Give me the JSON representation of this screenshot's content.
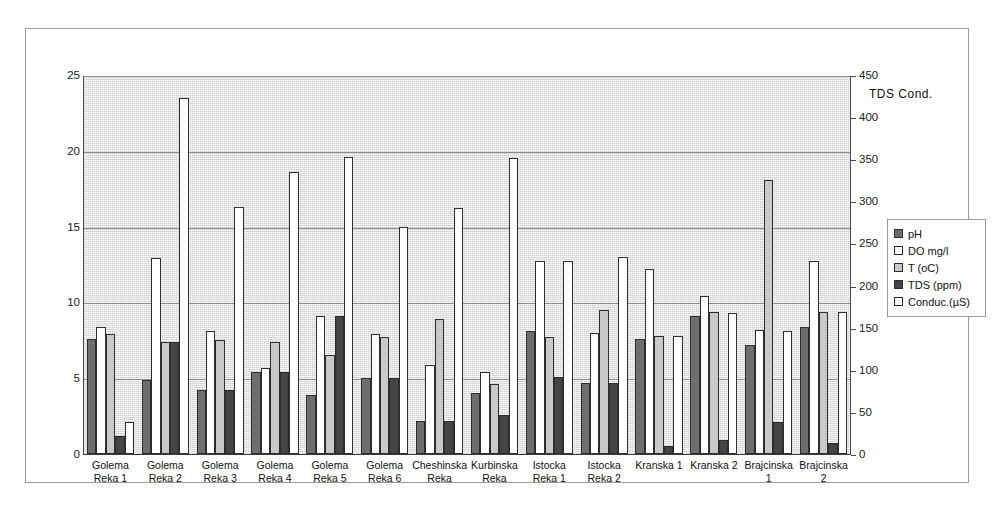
{
  "chart_data": {
    "type": "bar",
    "title": "",
    "xlabel": "",
    "ylabel": "",
    "y2label": "TDS  Cond.",
    "grid": true,
    "legend_position": "right",
    "ylim": [
      0,
      25
    ],
    "y2lim": [
      0,
      450
    ],
    "yticks": [
      0,
      5,
      10,
      15,
      20,
      25
    ],
    "y2ticks": [
      0,
      50,
      100,
      150,
      200,
      250,
      300,
      350,
      400,
      450
    ],
    "categories": [
      "Golema Reka 1",
      "Golema Reka 2",
      "Golema Reka 3",
      "Golema Reka 4",
      "Golema Reka 5",
      "Golema Reka 6",
      "Cheshinska Reka",
      "Kurbinska Reka",
      "Istocka Reka 1",
      "Istocka Reka 2",
      "Kranska 1",
      "Kranska 2",
      "Brajcinska 1",
      "Brajcinska 2"
    ],
    "category_lines": [
      [
        "Golema",
        "Reka 1"
      ],
      [
        "Golema",
        "Reka 2"
      ],
      [
        "Golema",
        "Reka 3"
      ],
      [
        "Golema",
        "Reka 4"
      ],
      [
        "Golema",
        "Reka 5"
      ],
      [
        "Golema",
        "Reka 6"
      ],
      [
        "Cheshinska",
        "Reka"
      ],
      [
        "Kurbinska",
        "Reka"
      ],
      [
        "Istocka",
        "Reka 1"
      ],
      [
        "Istocka",
        "Reka 2"
      ],
      [
        "Kranska 1",
        ""
      ],
      [
        "Kranska 2",
        ""
      ],
      [
        "Brajcinska",
        "1"
      ],
      [
        "Brajcinska",
        "2"
      ]
    ],
    "series": [
      {
        "name": "pH",
        "axis": "left",
        "color": "#6e6e6e",
        "values": [
          7.6,
          4.9,
          4.2,
          5.4,
          3.9,
          5.0,
          2.2,
          4.0,
          8.1,
          4.7,
          7.6,
          9.1,
          7.2,
          8.4
        ]
      },
      {
        "name": "DO mg/l",
        "axis": "left",
        "color": "#ffffff",
        "values": [
          8.4,
          12.9,
          8.1,
          5.7,
          9.1,
          7.9,
          5.9,
          5.4,
          12.7,
          8.0,
          12.2,
          10.4,
          8.2,
          12.7
        ]
      },
      {
        "name": "T (oC)",
        "axis": "left",
        "color": "#c9c9c9",
        "values": [
          7.9,
          7.4,
          7.5,
          7.4,
          6.5,
          7.7,
          8.9,
          4.6,
          7.7,
          9.5,
          7.8,
          9.4,
          18.1,
          9.4
        ]
      },
      {
        "name": "TDS (ppm)",
        "axis": "right",
        "color": "#454545",
        "values": [
          22,
          133,
          75,
          97,
          164,
          90,
          40,
          47,
          92,
          84,
          10,
          16,
          38,
          13
        ]
      },
      {
        "name": "Conduc.(µS)",
        "axis": "right",
        "color": "#ffffff",
        "values": [
          38,
          423,
          293,
          334,
          353,
          270,
          292,
          352,
          228,
          234,
          140,
          168,
          146,
          170
        ]
      }
    ],
    "series_left_equiv": [
      [
        7.6,
        4.9,
        4.2,
        5.4,
        3.9,
        5.0,
        2.2,
        4.0,
        8.1,
        4.7,
        7.6,
        9.1,
        7.2,
        8.4
      ],
      [
        8.4,
        12.9,
        8.1,
        5.7,
        9.1,
        7.9,
        5.9,
        5.4,
        12.7,
        8.0,
        12.2,
        10.4,
        8.2,
        12.7
      ],
      [
        7.9,
        7.4,
        7.5,
        7.4,
        6.5,
        7.7,
        8.9,
        4.6,
        7.7,
        9.5,
        7.8,
        9.4,
        18.1,
        9.4
      ],
      [
        1.2,
        7.4,
        4.2,
        5.4,
        9.1,
        5.0,
        2.2,
        2.6,
        5.1,
        4.7,
        0.55,
        0.9,
        2.1,
        0.7
      ],
      [
        2.1,
        23.5,
        16.3,
        18.6,
        19.6,
        15.0,
        16.2,
        19.5,
        12.7,
        13.0,
        7.8,
        9.3,
        8.1,
        9.4
      ]
    ]
  },
  "legend": {
    "items": [
      {
        "label": "pH"
      },
      {
        "label": "DO mg/l"
      },
      {
        "label": "T (oC)"
      },
      {
        "label": "TDS (ppm)"
      },
      {
        "label": "Conduc.(µS)"
      }
    ]
  },
  "axes": {
    "left_ticks": [
      "25",
      "20",
      "15",
      "10",
      "5",
      "0"
    ],
    "right_ticks": [
      "450",
      "400",
      "350",
      "300",
      "250",
      "200",
      "150",
      "100",
      "50",
      "0"
    ],
    "right_title": "TDS  Cond."
  }
}
